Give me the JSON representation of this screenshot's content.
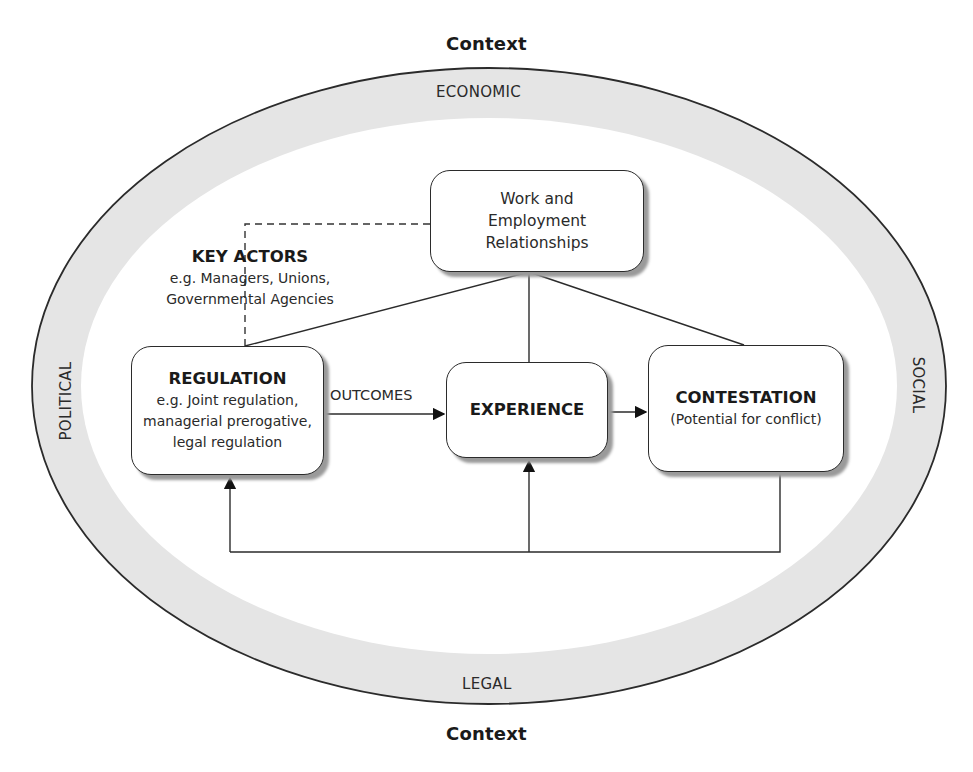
{
  "context": {
    "top_label": "Context",
    "bottom_label": "Context"
  },
  "ring": {
    "top": "ECONOMIC",
    "bottom": "LEGAL",
    "left": "POLITICAL",
    "right": "SOCIAL",
    "band_color": "#e6e6e6"
  },
  "nodes": {
    "work": {
      "line1": "Work and",
      "line2": "Employment",
      "line3": "Relationships"
    },
    "regulation": {
      "title": "REGULATION",
      "line1": "e.g. Joint regulation,",
      "line2": "managerial prerogative,",
      "line3": "legal regulation"
    },
    "experience": {
      "title": "EXPERIENCE"
    },
    "contestation": {
      "title": "CONTESTATION",
      "subtitle": "(Potential for conflict)"
    }
  },
  "key_actors": {
    "title": "KEY ACTORS",
    "line1": "e.g. Managers, Unions,",
    "line2": "Governmental Agencies"
  },
  "edges": {
    "outcomes_label": "OUTCOMES"
  }
}
